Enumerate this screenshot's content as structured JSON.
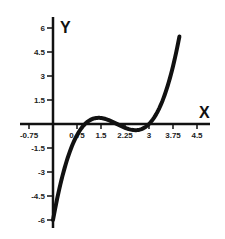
{
  "chart_data": {
    "type": "line",
    "title": "",
    "xlabel": "X",
    "ylabel": "Y",
    "function": "y = (x-1)(x-2)(x-3)",
    "xlim": [
      -1.0,
      4.9
    ],
    "ylim": [
      -6.5,
      6.6
    ],
    "grid": false,
    "legend": null,
    "x_ticks": [
      -0.75,
      0.75,
      1.5,
      2.25,
      3,
      3.75,
      4.5
    ],
    "x_tick_labels": [
      "-0.75",
      "0.75",
      "1.5",
      "2.25",
      "3",
      "3.75",
      "4.5"
    ],
    "y_ticks": [
      6,
      4.5,
      3,
      1.5,
      -1.5,
      -3,
      -4.5,
      -6
    ],
    "y_tick_labels": [
      "6",
      "4.5",
      "3",
      "1.5",
      "-1.5",
      "-3",
      "-4.5",
      "-6"
    ],
    "series": [
      {
        "name": "curve",
        "color": "#111111",
        "x": [
          0,
          0.25,
          0.5,
          0.75,
          1,
          1.25,
          1.5,
          1.75,
          2,
          2.25,
          2.5,
          2.75,
          3,
          3.25,
          3.5,
          3.75,
          3.95
        ],
        "values": [
          -6,
          -3.28,
          -1.875,
          -0.98,
          0,
          0.33,
          0.375,
          0.23,
          0,
          -0.23,
          -0.375,
          -0.33,
          0,
          0.98,
          1.875,
          3.28,
          5.33
        ]
      }
    ]
  },
  "pixel_map": {
    "origin_x": 53,
    "origin_y": 124,
    "px_per_x_unit": 32,
    "px_per_y_unit": 16
  }
}
